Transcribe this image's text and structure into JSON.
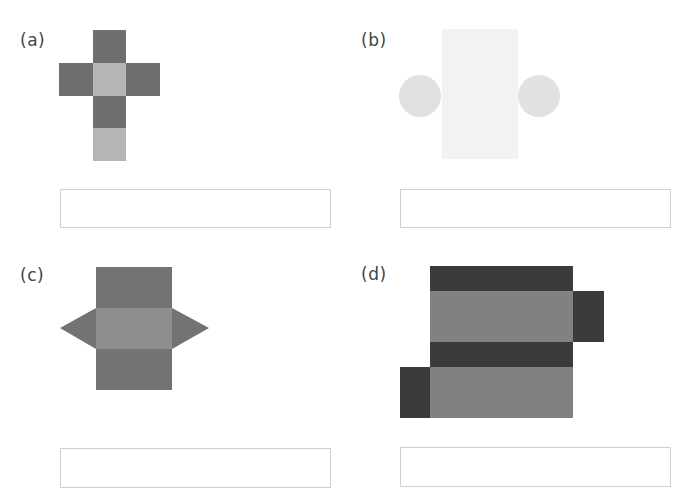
{
  "panels": [
    {
      "id": "a",
      "label": "(a)",
      "figure": "cube net (cross of six squares)",
      "answer": ""
    },
    {
      "id": "b",
      "label": "(b)",
      "figure": "cylinder net (rectangle with two circles)",
      "answer": ""
    },
    {
      "id": "c",
      "label": "(c)",
      "figure": "triangular prism net (three rectangles with two triangles)",
      "answer": ""
    },
    {
      "id": "d",
      "label": "(d)",
      "figure": "rectangular prism net (four bands with two side faces)",
      "answer": ""
    }
  ],
  "colors": {
    "a_dark": "#6f6f6f",
    "a_light": "#b5b5b5",
    "b_rect": "#f2f2f2",
    "b_circle": "#e1e1e1",
    "c_dark": "#737373",
    "c_mid": "#8e8e8e",
    "d_dark": "#3b3b3b",
    "d_gray": "#818181"
  }
}
